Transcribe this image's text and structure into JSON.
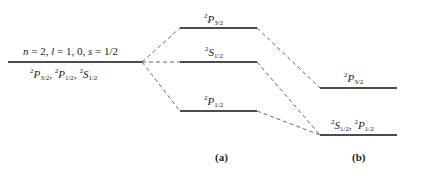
{
  "diagram": {
    "type": "energy-level-diagram",
    "unperturbed": {
      "quantum_numbers": "n = 2, l = 1, 0, s = 1/2",
      "states": "2P3/2, 2P1/2, 2S1/2",
      "state_parts": [
        {
          "sup": "2",
          "letter": "P",
          "sub": "3/2"
        },
        {
          "sup": "2",
          "letter": "P",
          "sub": "1/2"
        },
        {
          "sup": "2",
          "letter": "S",
          "sub": "1/2"
        }
      ]
    },
    "panel_a": {
      "caption": "(a)",
      "levels": [
        {
          "sup": "2",
          "letter": "P",
          "sub": "3/2"
        },
        {
          "sup": "2",
          "letter": "S",
          "sub": "1/2"
        },
        {
          "sup": "2",
          "letter": "P",
          "sub": "1/2"
        }
      ]
    },
    "panel_b": {
      "caption": "(b)",
      "levels": [
        {
          "label_parts": [
            {
              "sup": "2",
              "letter": "P",
              "sub": "3/2"
            }
          ]
        },
        {
          "label_parts": [
            {
              "sup": "2",
              "letter": "S",
              "sub": "1/2"
            },
            {
              "sup": "2",
              "letter": "P",
              "sub": "1/2"
            }
          ]
        }
      ]
    }
  }
}
